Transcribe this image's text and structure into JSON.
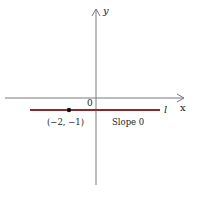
{
  "diagram": {
    "type": "coordinate-plane-line",
    "axes": {
      "x_label": "x",
      "y_label": "y",
      "origin_label": "0"
    },
    "line": {
      "name": "l",
      "color": "#8b2a2a",
      "slope_label": "Slope 0"
    },
    "point": {
      "label": "(−2, −1)",
      "x": -2,
      "y": -1
    },
    "colors": {
      "axis": "#7a7a7a",
      "line": "#8b2a2a",
      "point": "#111111",
      "text": "#222222"
    }
  }
}
